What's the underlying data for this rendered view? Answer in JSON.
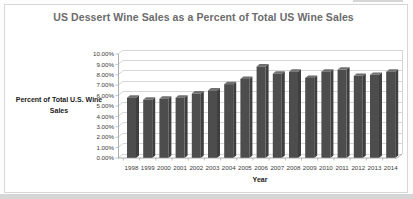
{
  "chart_data": {
    "type": "bar",
    "title": "US Dessert Wine Sales as a Percent of Total US Wine Sales",
    "xlabel": "Year",
    "ylabel": "Percent of Total U.S. Wine Sales",
    "ylabel_lines": [
      "Percent of Total U.S. Wine",
      "Sales"
    ],
    "categories": [
      "1998",
      "1999",
      "2000",
      "2001",
      "2002",
      "2003",
      "2004",
      "2005",
      "2006",
      "2007",
      "2008",
      "2009",
      "2010",
      "2011",
      "2012",
      "2013",
      "2014"
    ],
    "values": [
      5.8,
      5.6,
      5.7,
      5.8,
      6.2,
      6.5,
      7.1,
      7.6,
      8.8,
      8.1,
      8.3,
      7.7,
      8.3,
      8.5,
      7.9,
      8.0,
      8.3
    ],
    "ylim": [
      0,
      10
    ],
    "ytick_step": 1,
    "ytick_labels": [
      "0.00%",
      "1.00%",
      "2.00%",
      "3.00%",
      "4.00%",
      "5.00%",
      "6.00%",
      "7.00%",
      "8.00%",
      "9.00%",
      "10.00%"
    ],
    "grid": true,
    "legend": "none",
    "effect": "3d-column",
    "style": {
      "bar_color": "#4d4d4d",
      "bar_top_color": "#6f6f6f",
      "bar_side_color": "#3f3f3f",
      "gridline_color": "#c4c4c4",
      "axis_color": "#9b9b9b",
      "tick_label_color": "#3b3b3b",
      "title_color": "#6b6b6b",
      "frame_border_color": "#d7d7d7"
    }
  }
}
